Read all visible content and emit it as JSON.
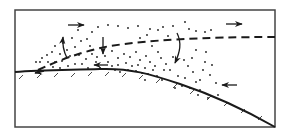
{
  "diagram": {
    "type": "cross-section schematic",
    "colors": {
      "ink": "#1a1a1a",
      "background": "#ffffff",
      "frame": "#444444"
    },
    "frame": {
      "x": 15,
      "y": 10,
      "width": 260,
      "height": 117
    },
    "ground_line": {
      "path": "M15,72 C40,70 70,70 100,69 C130,68 150,74 180,84 C210,94 245,110 275,127",
      "hatch_marks": [
        [
          22,
          74
        ],
        [
          40,
          73
        ],
        [
          57,
          72
        ],
        [
          74,
          72
        ],
        [
          91,
          71
        ],
        [
          108,
          71
        ],
        [
          125,
          72
        ],
        [
          142,
          74
        ],
        [
          159,
          78
        ],
        [
          176,
          83
        ],
        [
          193,
          89
        ],
        [
          210,
          95
        ],
        [
          227,
          101
        ],
        [
          244,
          108
        ],
        [
          261,
          115
        ]
      ]
    },
    "dashed_boundary": {
      "path": "M38,70 C60,60 80,52 110,46 C150,40 200,37 275,37",
      "style": "dashed"
    },
    "arrows": [
      {
        "name": "wind-right-top-left",
        "x1": 68,
        "y1": 25,
        "x2": 84,
        "y2": 25,
        "direction": "right"
      },
      {
        "name": "wind-right-top-right",
        "x1": 226,
        "y1": 24,
        "x2": 242,
        "y2": 24,
        "direction": "right"
      },
      {
        "name": "updraft-left",
        "path": "M67,58 C64,52 62,46 63,37",
        "direction": "up"
      },
      {
        "name": "downdraft-center",
        "x1": 103,
        "y1": 37,
        "x2": 103,
        "y2": 54,
        "direction": "down"
      },
      {
        "name": "downdraft-curved",
        "path": "M177,33 C182,43 180,52 175,63",
        "direction": "down"
      },
      {
        "name": "wind-left-mid",
        "x1": 108,
        "y1": 65,
        "x2": 94,
        "y2": 65,
        "direction": "left"
      },
      {
        "name": "wind-left-right",
        "x1": 237,
        "y1": 85,
        "x2": 222,
        "y2": 85,
        "direction": "left"
      },
      {
        "name": "surface-left",
        "x1": 44,
        "y1": 71,
        "x2": 35,
        "y2": 73,
        "direction": "left"
      }
    ],
    "dots": [
      [
        98,
        27
      ],
      [
        108,
        25
      ],
      [
        118,
        26
      ],
      [
        128,
        28
      ],
      [
        138,
        26
      ],
      [
        150,
        29
      ],
      [
        163,
        27
      ],
      [
        173,
        26
      ],
      [
        185,
        22
      ],
      [
        189,
        29
      ],
      [
        196,
        31
      ],
      [
        205,
        32
      ],
      [
        211,
        30
      ],
      [
        140,
        38
      ],
      [
        147,
        35
      ],
      [
        158,
        30
      ],
      [
        168,
        36
      ],
      [
        81,
        41
      ],
      [
        87,
        39
      ],
      [
        90,
        46
      ],
      [
        75,
        47
      ],
      [
        67,
        50
      ],
      [
        60,
        54
      ],
      [
        52,
        52
      ],
      [
        47,
        55
      ],
      [
        42,
        58
      ],
      [
        40,
        62
      ],
      [
        36,
        62
      ],
      [
        48,
        62
      ],
      [
        55,
        62
      ],
      [
        62,
        61
      ],
      [
        70,
        56
      ],
      [
        79,
        55
      ],
      [
        86,
        59
      ],
      [
        92,
        54
      ],
      [
        97,
        57
      ],
      [
        105,
        56
      ],
      [
        112,
        51
      ],
      [
        118,
        58
      ],
      [
        124,
        54
      ],
      [
        130,
        57
      ],
      [
        136,
        52
      ],
      [
        140,
        60
      ],
      [
        146,
        56
      ],
      [
        150,
        62
      ],
      [
        152,
        46
      ],
      [
        158,
        52
      ],
      [
        161,
        58
      ],
      [
        166,
        64
      ],
      [
        170,
        70
      ],
      [
        153,
        70
      ],
      [
        157,
        76
      ],
      [
        145,
        68
      ],
      [
        138,
        65
      ],
      [
        132,
        66
      ],
      [
        126,
        63
      ],
      [
        118,
        65
      ],
      [
        115,
        70
      ],
      [
        120,
        72
      ],
      [
        128,
        70
      ],
      [
        136,
        71
      ],
      [
        142,
        73
      ],
      [
        148,
        74
      ],
      [
        155,
        66
      ],
      [
        164,
        70
      ],
      [
        173,
        57
      ],
      [
        178,
        76
      ],
      [
        185,
        78
      ],
      [
        188,
        66
      ],
      [
        193,
        72
      ],
      [
        196,
        82
      ],
      [
        200,
        80
      ],
      [
        200,
        90
      ],
      [
        205,
        62
      ],
      [
        210,
        75
      ],
      [
        216,
        83
      ],
      [
        218,
        95
      ],
      [
        208,
        98
      ],
      [
        198,
        95
      ],
      [
        190,
        88
      ],
      [
        182,
        86
      ],
      [
        175,
        88
      ],
      [
        162,
        80
      ],
      [
        53,
        67
      ],
      [
        60,
        68
      ],
      [
        68,
        66
      ],
      [
        75,
        64
      ],
      [
        82,
        64
      ],
      [
        88,
        68
      ],
      [
        96,
        62
      ],
      [
        100,
        68
      ],
      [
        108,
        62
      ],
      [
        112,
        66
      ],
      [
        145,
        80
      ],
      [
        55,
        46
      ],
      [
        63,
        43
      ],
      [
        72,
        38
      ],
      [
        92,
        32
      ],
      [
        78,
        30
      ],
      [
        196,
        50
      ],
      [
        192,
        58
      ],
      [
        184,
        60
      ],
      [
        206,
        52
      ],
      [
        212,
        65
      ],
      [
        203,
        70
      ]
    ]
  }
}
